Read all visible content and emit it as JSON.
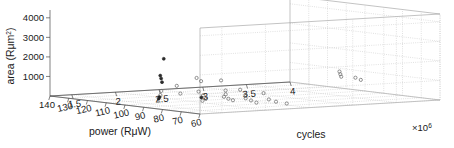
{
  "chart_data": {
    "type": "scatter",
    "title": "",
    "subtitle": "",
    "projection": "3d",
    "grid": true,
    "legend": null,
    "xlabel": "power (RμW)",
    "ylabel": "cycles",
    "zlabel": "area (Rμm²)",
    "x_axis": {
      "name": "power",
      "unit": "RμW",
      "ticks": [
        140,
        130,
        120,
        110,
        100,
        90,
        80,
        70,
        60
      ],
      "tick_labels": [
        "140",
        "130",
        "120",
        "110",
        "100",
        "90",
        "80",
        "70",
        "60"
      ],
      "lim": [
        140,
        60
      ],
      "direction": "descending"
    },
    "y_axis": {
      "name": "cycles",
      "unit": "",
      "multiplier": "×10⁶",
      "multiplier_base": "×10",
      "multiplier_exponent": "6",
      "ticks": [
        1.5,
        2,
        2.5,
        3,
        3.5,
        4
      ],
      "tick_labels": [
        "1.5",
        "2",
        "2.5",
        "3",
        "3.5",
        "4"
      ],
      "lim": [
        1.25,
        4
      ]
    },
    "z_axis": {
      "name": "area",
      "unit": "Rμm²",
      "ticks": [
        1000,
        2000,
        3000,
        4000
      ],
      "tick_labels": [
        "1000",
        "2000",
        "3000",
        "4000"
      ],
      "lim": [
        0,
        4400
      ]
    },
    "points": [
      {
        "power": 104,
        "cycles": 1.78,
        "area": 2180,
        "style": "filled"
      },
      {
        "power": 104,
        "cycles": 1.74,
        "area": 1330,
        "style": "filled"
      },
      {
        "power": 104,
        "cycles": 1.75,
        "area": 1180,
        "style": "filled"
      },
      {
        "power": 104,
        "cycles": 1.76,
        "area": 990,
        "style": "filled"
      },
      {
        "power": 103,
        "cycles": 1.73,
        "area": 560,
        "style": "open"
      },
      {
        "power": 103,
        "cycles": 1.72,
        "area": 350,
        "style": "open"
      },
      {
        "power": 103,
        "cycles": 1.71,
        "area": 250,
        "style": "filled"
      },
      {
        "power": 103,
        "cycles": 1.7,
        "area": 170,
        "style": "filled"
      },
      {
        "power": 98,
        "cycles": 1.8,
        "area": 860,
        "style": "open"
      },
      {
        "power": 97,
        "cycles": 1.82,
        "area": 470,
        "style": "open"
      },
      {
        "power": 93,
        "cycles": 1.92,
        "area": 1290,
        "style": "open"
      },
      {
        "power": 92,
        "cycles": 1.95,
        "area": 1130,
        "style": "open"
      },
      {
        "power": 91,
        "cycles": 1.9,
        "area": 620,
        "style": "open"
      },
      {
        "power": 90,
        "cycles": 1.93,
        "area": 430,
        "style": "open"
      },
      {
        "power": 90,
        "cycles": 1.91,
        "area": 330,
        "style": "filled"
      },
      {
        "power": 89,
        "cycles": 1.94,
        "area": 260,
        "style": "open"
      },
      {
        "power": 88,
        "cycles": 1.88,
        "area": 190,
        "style": "open"
      },
      {
        "power": 86,
        "cycles": 2.05,
        "area": 1210,
        "style": "open"
      },
      {
        "power": 85,
        "cycles": 2.08,
        "area": 700,
        "style": "open"
      },
      {
        "power": 84,
        "cycles": 2.06,
        "area": 520,
        "style": "open"
      },
      {
        "power": 84,
        "cycles": 2.04,
        "area": 400,
        "style": "open"
      },
      {
        "power": 83,
        "cycles": 2.07,
        "area": 300,
        "style": "open"
      },
      {
        "power": 82,
        "cycles": 2.1,
        "area": 230,
        "style": "open"
      },
      {
        "power": 80,
        "cycles": 2.14,
        "area": 780,
        "style": "open"
      },
      {
        "power": 79,
        "cycles": 2.18,
        "area": 520,
        "style": "open"
      },
      {
        "power": 78,
        "cycles": 2.16,
        "area": 360,
        "style": "open"
      },
      {
        "power": 77,
        "cycles": 2.2,
        "area": 250,
        "style": "open"
      },
      {
        "power": 76,
        "cycles": 2.24,
        "area": 140,
        "style": "open"
      },
      {
        "power": 75,
        "cycles": 2.3,
        "area": 620,
        "style": "open"
      },
      {
        "power": 74,
        "cycles": 2.34,
        "area": 300,
        "style": "open"
      },
      {
        "power": 73,
        "cycles": 2.4,
        "area": 180,
        "style": "open"
      },
      {
        "power": 71,
        "cycles": 2.48,
        "area": 90,
        "style": "open"
      },
      {
        "power": 68,
        "cycles": 3.02,
        "area": 1620,
        "style": "open"
      },
      {
        "power": 68,
        "cycles": 3.03,
        "area": 1480,
        "style": "open"
      },
      {
        "power": 68,
        "cycles": 3.04,
        "area": 1350,
        "style": "open"
      },
      {
        "power": 66,
        "cycles": 3.16,
        "area": 1290,
        "style": "open"
      },
      {
        "power": 65,
        "cycles": 3.2,
        "area": 1180,
        "style": "open"
      }
    ]
  }
}
